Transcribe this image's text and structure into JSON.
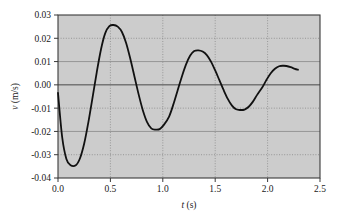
{
  "chart_data": {
    "type": "line",
    "title": "",
    "xlabel": "t (s)",
    "ylabel": "v (m/s)",
    "xlabel_var": "t",
    "xlabel_unit": "(s)",
    "ylabel_var": "v",
    "ylabel_unit": "(m/s)",
    "xlim": [
      0.0,
      2.5
    ],
    "ylim": [
      -0.04,
      0.03
    ],
    "xticks": [
      "0.0",
      "0.5",
      "1.0",
      "1.5",
      "2.0",
      "2.5"
    ],
    "xtick_values": [
      0.0,
      0.5,
      1.0,
      1.5,
      2.0,
      2.5
    ],
    "yticks": [
      "0.03",
      "0.02",
      "0.01",
      "0.00",
      "-0.01",
      "-0.02",
      "-0.03",
      "-0.04"
    ],
    "ytick_values": [
      0.03,
      0.02,
      0.01,
      0.0,
      -0.01,
      -0.02,
      -0.03,
      -0.04
    ],
    "grid": true,
    "grid_style": "solid horizontal at 0.03/0.01/0.00/-0.02/-0.04, dotted horizontal at 0.02/-0.01/-0.03, dotted vertical at all x ticks",
    "legend": "none",
    "plot_background": "#cccccc",
    "line_color": "#111111",
    "line_width": 1.8,
    "annotations": [
      {
        "label": "start",
        "x": 0.0,
        "y": -0.0035
      },
      {
        "label": "trough 1",
        "x": 0.17,
        "y": -0.0345
      },
      {
        "label": "peak 1",
        "x": 0.57,
        "y": 0.0257
      },
      {
        "label": "trough 2",
        "x": 0.97,
        "y": -0.0192
      },
      {
        "label": "peak 2",
        "x": 1.38,
        "y": 0.0148
      },
      {
        "label": "trough 3",
        "x": 1.78,
        "y": -0.0108
      },
      {
        "label": "peak 3",
        "x": 2.18,
        "y": 0.0082
      },
      {
        "label": "end",
        "x": 2.29,
        "y": 0.0065
      }
    ],
    "x": [
      0.0,
      0.04,
      0.08,
      0.12,
      0.17,
      0.21,
      0.25,
      0.29,
      0.33,
      0.37,
      0.41,
      0.45,
      0.49,
      0.53,
      0.57,
      0.61,
      0.65,
      0.69,
      0.73,
      0.77,
      0.81,
      0.85,
      0.89,
      0.93,
      0.97,
      1.01,
      1.06,
      1.1,
      1.14,
      1.18,
      1.22,
      1.26,
      1.3,
      1.34,
      1.38,
      1.42,
      1.46,
      1.5,
      1.54,
      1.58,
      1.62,
      1.66,
      1.7,
      1.74,
      1.78,
      1.82,
      1.86,
      1.9,
      1.95,
      1.99,
      2.03,
      2.07,
      2.11,
      2.15,
      2.18,
      2.22,
      2.26,
      2.29
    ],
    "values": [
      -0.0035,
      -0.0225,
      -0.0318,
      -0.0345,
      -0.0345,
      -0.0315,
      -0.0252,
      -0.016,
      -0.0054,
      0.0055,
      0.0152,
      0.0221,
      0.0252,
      0.0257,
      0.025,
      0.0227,
      0.018,
      0.0112,
      0.0035,
      -0.0042,
      -0.011,
      -0.016,
      -0.0187,
      -0.0192,
      -0.019,
      -0.0172,
      -0.0136,
      -0.0085,
      -0.0026,
      0.0033,
      0.0086,
      0.0125,
      0.0145,
      0.0148,
      0.0143,
      0.0128,
      0.01,
      0.0062,
      0.002,
      -0.0022,
      -0.006,
      -0.0089,
      -0.0105,
      -0.0108,
      -0.0106,
      -0.0094,
      -0.0072,
      -0.0043,
      -0.001,
      0.0022,
      0.005,
      0.0069,
      0.008,
      0.0082,
      0.0081,
      0.0076,
      0.0069,
      0.0065
    ]
  },
  "axes": {
    "x_title_prefix": "t",
    "x_title_suffix": "(s)",
    "y_title_prefix": "v",
    "y_title_suffix": "(m/s)"
  }
}
